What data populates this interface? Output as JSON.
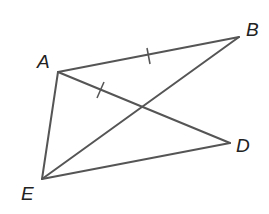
{
  "diagram": {
    "type": "geometry",
    "points": {
      "A": {
        "label": "A",
        "x": 58,
        "y": 72
      },
      "B": {
        "label": "B",
        "x": 239,
        "y": 37
      },
      "D": {
        "label": "D",
        "x": 230,
        "y": 143
      },
      "E": {
        "label": "E",
        "x": 42,
        "y": 179
      }
    },
    "segments": [
      "AB",
      "AD",
      "AE",
      "EB",
      "ED"
    ],
    "congruence_marks": [
      "AB",
      "AD"
    ],
    "line_color": "#555555"
  }
}
